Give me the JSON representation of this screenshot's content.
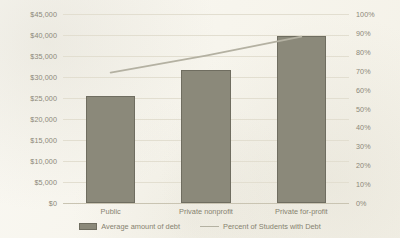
{
  "chart_data": {
    "type": "bar",
    "title": "",
    "subtitle": "",
    "xlabel": "",
    "ylabel": "",
    "y2label": "",
    "categories": [
      "Public",
      "Private nonprofit",
      "Private for-profit"
    ],
    "series": [
      {
        "name": "Average amount of debt",
        "type": "bar",
        "axis": "left",
        "values": [
          25500,
          31700,
          39700
        ],
        "color": "#8b897a"
      },
      {
        "name": "Percent of Students with Debt",
        "type": "line",
        "axis": "right",
        "values": [
          69,
          78,
          88
        ],
        "color": "#b4b1a2"
      }
    ],
    "ylim": [
      0,
      45000
    ],
    "y2lim": [
      0,
      100
    ],
    "y_ticks": [
      "$0",
      "$5,000",
      "$10,000",
      "$15,000",
      "$20,000",
      "$25,000",
      "$30,000",
      "$35,000",
      "$40,000",
      "$45,000"
    ],
    "y_tick_values": [
      0,
      5000,
      10000,
      15000,
      20000,
      25000,
      30000,
      35000,
      40000,
      45000
    ],
    "y2_ticks": [
      "0%",
      "10%",
      "20%",
      "30%",
      "40%",
      "50%",
      "60%",
      "70%",
      "80%",
      "90%",
      "100%"
    ],
    "y2_tick_values": [
      0,
      10,
      20,
      30,
      40,
      50,
      60,
      70,
      80,
      90,
      100
    ],
    "grid": true,
    "legend_position": "bottom"
  },
  "legend": {
    "items": [
      {
        "label": "Average amount of debt",
        "marker": "bar-swatch"
      },
      {
        "label": "Percent of Students with Debt",
        "marker": "line-swatch"
      }
    ]
  },
  "colors": {
    "background": "#f7f5ed",
    "bar_fill": "#8b897a",
    "bar_stroke": "#6f6d60",
    "line": "#b4b1a2",
    "gridline": "#e2ded0",
    "axis": "#c9c4b2",
    "text": "#8a8677"
  }
}
